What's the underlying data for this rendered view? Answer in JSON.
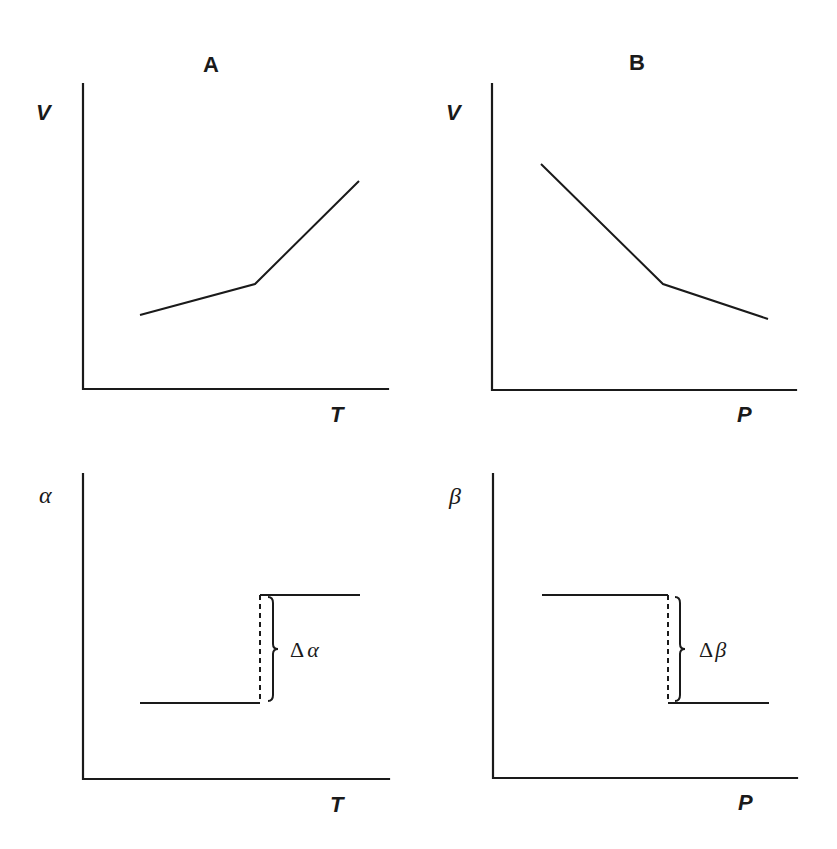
{
  "figure": {
    "panels": [
      {
        "id": "A-top",
        "title": "A",
        "ylabel": "V",
        "xlabel": "T",
        "axes": {
          "x0": 83,
          "y0": 389,
          "ytop": 84,
          "xright": 388
        },
        "curve": [
          [
            140,
            315
          ],
          [
            255,
            284
          ],
          [
            359,
            181
          ]
        ]
      },
      {
        "id": "B-top",
        "title": "B",
        "ylabel": "V",
        "xlabel": "P",
        "axes": {
          "x0": 492,
          "y0": 390,
          "ytop": 84,
          "xright": 796
        },
        "curve": [
          [
            541,
            164
          ],
          [
            663,
            284
          ],
          [
            768,
            319
          ]
        ]
      },
      {
        "id": "A-bottom",
        "ylabel": "α",
        "xlabel": "T",
        "axes": {
          "x0": 83,
          "y0": 779,
          "ytop": 474,
          "xright": 389
        },
        "steps": {
          "low": [
            [
              140,
              703
            ],
            [
              260,
              703
            ]
          ],
          "high": [
            [
              260,
              595
            ],
            [
              360,
              595
            ]
          ]
        },
        "dashed": [
          [
            260,
            595
          ],
          [
            260,
            703
          ]
        ],
        "brace": {
          "x": 268,
          "ytop": 597,
          "ybottom": 701
        },
        "delta_label": {
          "prefix": "Δ",
          "symbol": "α"
        }
      },
      {
        "id": "B-bottom",
        "ylabel": "β",
        "xlabel": "P",
        "axes": {
          "x0": 493,
          "y0": 778,
          "ytop": 474,
          "xright": 797
        },
        "steps": {
          "high": [
            [
              542,
              595
            ],
            [
              668,
              595
            ]
          ],
          "low": [
            [
              668,
              703
            ],
            [
              769,
              703
            ]
          ]
        },
        "dashed": [
          [
            668,
            595
          ],
          [
            668,
            703
          ]
        ],
        "brace": {
          "x": 675,
          "ytop": 597,
          "ybottom": 701
        },
        "delta_label": {
          "prefix": "Δ",
          "symbol": "β"
        }
      }
    ]
  },
  "chart_data": [
    {
      "type": "line",
      "title": "A",
      "xlabel": "T",
      "ylabel": "V",
      "x": [
        0.19,
        0.56,
        0.9
      ],
      "y": [
        0.24,
        0.34,
        0.68
      ],
      "annotations": [
        "slope change (kink) at glass transition"
      ],
      "grid": false
    },
    {
      "type": "line",
      "title": "B",
      "xlabel": "P",
      "ylabel": "V",
      "x": [
        0.16,
        0.56,
        0.91
      ],
      "y": [
        0.74,
        0.35,
        0.23
      ],
      "annotations": [
        "slope change (kink) at glass transition"
      ],
      "grid": false
    },
    {
      "type": "line",
      "title": "",
      "xlabel": "T",
      "ylabel": "α",
      "x": [
        0.19,
        0.58,
        0.58,
        0.91
      ],
      "y": [
        0.25,
        0.25,
        0.6,
        0.6
      ],
      "annotations": [
        "Δα (step increase, dashed vertical with brace)"
      ],
      "grid": false
    },
    {
      "type": "line",
      "title": "",
      "xlabel": "P",
      "ylabel": "β",
      "x": [
        0.16,
        0.58,
        0.58,
        0.91
      ],
      "y": [
        0.6,
        0.6,
        0.25,
        0.25
      ],
      "annotations": [
        "Δβ (step decrease, dashed vertical with brace)"
      ],
      "grid": false
    }
  ]
}
